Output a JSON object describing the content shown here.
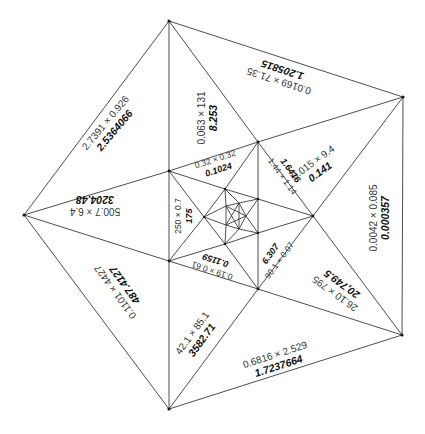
{
  "diagram": {
    "colors": {
      "line": "#3a3a3a",
      "text": "#333333",
      "product": "#111111",
      "background": "#ffffff"
    },
    "cells": [
      {
        "id": "c1",
        "expr": "2.7391 × 0.926",
        "product": "2.5364066"
      },
      {
        "id": "c2",
        "expr": "0.063 × 131",
        "product": "8.253"
      },
      {
        "id": "c3",
        "expr": "0.0169 × 71.35",
        "product": "1.205815"
      },
      {
        "id": "c4",
        "expr": "0.015 × 9.4",
        "product": "0.141"
      },
      {
        "id": "c5",
        "expr": "0.0042 × 0.085",
        "product": "0.000357"
      },
      {
        "id": "c6",
        "expr": "26.10 × 795",
        "product": "20,749.5"
      },
      {
        "id": "c7",
        "expr": "0.6816 × 2.529",
        "product": "1.7237664"
      },
      {
        "id": "c8",
        "expr": "42.1 × 85.1",
        "product": "3582.71"
      },
      {
        "id": "c9",
        "expr": "0.1101 × 4427",
        "product": "487.4127"
      },
      {
        "id": "c10",
        "expr": "500.7 × 6.4",
        "product": "3204.48"
      },
      {
        "id": "c11",
        "expr": "250 × 0.7",
        "product": "175"
      },
      {
        "id": "c12",
        "expr": "0.32 × 0.32",
        "product": "0.1024"
      },
      {
        "id": "c13",
        "expr": "1.44 × 1.14",
        "product": "1.6416"
      },
      {
        "id": "c14",
        "expr": "90.1 × 0.07",
        "product": "6.307"
      },
      {
        "id": "c15",
        "expr": "0.19 × 0.61",
        "product": "0.1159"
      }
    ]
  }
}
